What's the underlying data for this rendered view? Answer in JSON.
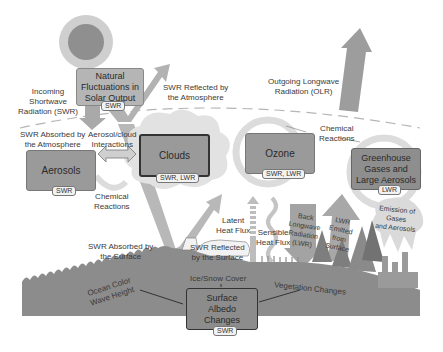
{
  "diagram": {
    "boxes": {
      "solar": {
        "label": "Natural Fluctuations in Solar Output",
        "line1": "Natural",
        "line2": "Fluctuations in",
        "line3": "Solar Output",
        "tag": "SWR"
      },
      "aerosols": {
        "label": "Aerosols",
        "tag": "SWR"
      },
      "clouds": {
        "label": "Clouds",
        "tag": "SWR, LWR"
      },
      "ozone": {
        "label": "Ozone",
        "tag": "SWR, LWR"
      },
      "ghg": {
        "line1": "Greenhouse",
        "line2": "Gases and",
        "line3": "Large Aerosols",
        "tag": "LWR"
      },
      "albedo": {
        "line1": "Surface",
        "line2": "Albedo",
        "line3": "Changes",
        "tag": "SWR"
      }
    },
    "labels": {
      "incoming_swr": {
        "line1": "Incoming",
        "line2": "Shortwave",
        "line3": "Radiation (SWR)"
      },
      "swr_reflected_atm": {
        "line1": "SWR Reflected by",
        "line2": "the Atmosphere"
      },
      "olr": {
        "line1": "Outgoing Longwave",
        "line2": "Radiation (OLR)"
      },
      "swr_absorbed_atm": {
        "line1": "SWR Absorbed by",
        "line2": "the Atmosphere"
      },
      "aerosol_cloud": {
        "line1": "Aerosol/cloud",
        "line2": "Interactions"
      },
      "chem_reactions_left": {
        "line1": "Chemical",
        "line2": "Reactions"
      },
      "chem_reactions_right": {
        "line1": "Chemical",
        "line2": "Reactions"
      },
      "swr_absorbed_surface": {
        "line1": "SWR Absorbed by",
        "line2": "the Surface"
      },
      "swr_reflected_surface": {
        "line1": "SWR Reflected",
        "line2": "by the Surface"
      },
      "latent_heat": {
        "line1": "Latent",
        "line2": "Heat Flux"
      },
      "sensible_heat": {
        "line1": "Sensible",
        "line2": "Heat Flux"
      },
      "back_lwr": {
        "line1": "Back",
        "line2": "Longwave",
        "line3": "Radiation",
        "line4": "(LWR)"
      },
      "lwr_emitted": {
        "line1": "LWR",
        "line2": "Emitted",
        "line3": "from",
        "line4": "Surface"
      },
      "emission": {
        "line1": "Emission of",
        "line2": "Gases",
        "line3": "and Aerosols"
      },
      "ice_snow": "Ice/Snow Cover",
      "ocean": {
        "line1": "Ocean Color",
        "line2": "Wave Height"
      },
      "vegetation": "Vegetation Changes"
    },
    "colors": {
      "box_fill": "#9a9a9a",
      "box_border": "#6e6e6e",
      "arrow_fill": "#b8b8b8",
      "ground": "#8c8c8c",
      "cloud": "#dedede",
      "sun": "#8f8f8f"
    }
  }
}
